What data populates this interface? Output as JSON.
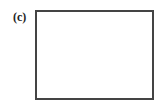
{
  "panel": {
    "label": "(c)",
    "content": ""
  },
  "colors": {
    "border": "#444444",
    "label": "#222222",
    "background": "#ffffff"
  }
}
